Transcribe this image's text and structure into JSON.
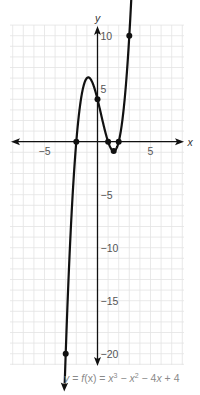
{
  "chart_data": {
    "type": "line",
    "title": "",
    "function_label": "y = f(x) = x^3 − x^2 − 4x + 4",
    "caption": {
      "lhs": "y",
      "eq1": " = ",
      "f": "f",
      "fx": "(x)",
      "eq2": " = ",
      "x1": "x",
      "p1": "3",
      "minus1": " − ",
      "x2": "x",
      "p2": "2",
      "rest": " − 4",
      "x3": "x",
      "tail": " + 4"
    },
    "xlabel": "x",
    "ylabel": "y",
    "xlim": [
      -8,
      8
    ],
    "ylim": [
      -21,
      11
    ],
    "grid": true,
    "x_ticks": [
      {
        "value": -5,
        "label": "−5"
      },
      {
        "value": 5,
        "label": "5"
      }
    ],
    "y_ticks": [
      {
        "value": 10,
        "label": "10"
      },
      {
        "value": 5,
        "label": "5"
      },
      {
        "value": -5,
        "label": "−5"
      },
      {
        "value": -10,
        "label": "−10"
      },
      {
        "value": -15,
        "label": "−15"
      },
      {
        "value": -20,
        "label": "−20"
      }
    ],
    "series": [
      {
        "name": "f(x) = x^3 − x^2 − 4x + 4",
        "domain": [
          -3.1,
          3.35
        ],
        "coefficients": [
          1,
          -1,
          -4,
          4
        ],
        "marked_points": [
          {
            "x": -3,
            "y": -20
          },
          {
            "x": -2,
            "y": 0
          },
          {
            "x": 0,
            "y": 4
          },
          {
            "x": 1,
            "y": 0
          },
          {
            "x": 1.53,
            "y": -0.88
          },
          {
            "x": 2,
            "y": 0
          },
          {
            "x": 3,
            "y": 10
          }
        ],
        "local_max": {
          "x": -0.87,
          "y": 6.06
        },
        "local_min": {
          "x": 1.53,
          "y": -0.88
        }
      }
    ],
    "colors": {
      "grid": "#e3e3e3",
      "axes": "#111111",
      "curve": "#111111",
      "tick_labels": "#555555",
      "caption": "#8a8a8a"
    }
  }
}
